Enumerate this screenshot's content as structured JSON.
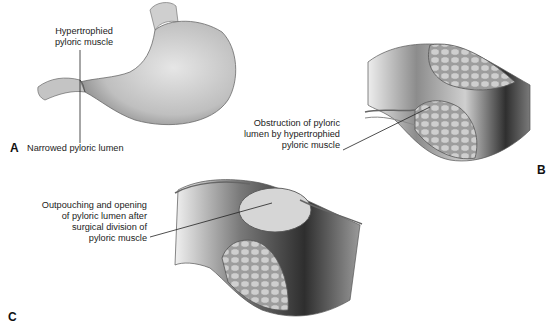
{
  "figure": {
    "panels": [
      {
        "id": "A",
        "letter": "A",
        "subject": "stomach-with-hypertrophied-pylorus",
        "labels": {
          "top": [
            "Hypertrophied",
            "pyloric muscle"
          ],
          "bottom": "Narrowed pyloric lumen"
        }
      },
      {
        "id": "B",
        "letter": "B",
        "subject": "cross-section-obstructed-pylorus",
        "labels": {
          "main": [
            "Obstruction of pyloric",
            "lumen by hypertrophied",
            "pyloric muscle"
          ]
        }
      },
      {
        "id": "C",
        "letter": "C",
        "subject": "cross-section-after-pyloromyotomy",
        "labels": {
          "main": [
            "Outpouching and opening",
            "of pyloric lumen after",
            "surgical division of",
            "pyloric muscle"
          ]
        }
      }
    ],
    "colors": {
      "background": "#ffffff",
      "tissue_light": "#d9d9d9",
      "tissue_mid": "#a8a8a8",
      "tissue_dark": "#3a3a3a",
      "muscle_cells": "#bdbdbd",
      "leader_line": "#222222",
      "text": "#222222"
    }
  }
}
